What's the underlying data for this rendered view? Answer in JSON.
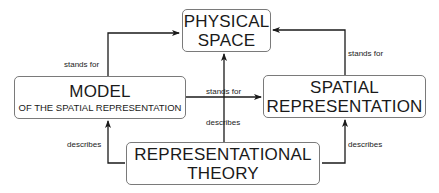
{
  "nodes": {
    "physical_space": {
      "line1": "PHYSICAL",
      "line2": "SPACE"
    },
    "model": {
      "title": "MODEL",
      "subtitle": "OF THE SPATIAL REPRESENTATION"
    },
    "spatial_representation": {
      "line1": "SPATIAL",
      "line2": "REPRESENTATION"
    },
    "representational_theory": {
      "line1": "REPRESENTATIONAL",
      "line2": "THEORY"
    }
  },
  "edges": {
    "model_to_physical": "stands for",
    "spatial_to_physical": "stands for",
    "model_to_spatial": "stands for",
    "theory_to_physical": "describes",
    "theory_to_model": "describes",
    "theory_to_spatial": "describes"
  },
  "colors": {
    "line": "#1a1a1a",
    "border": "#7a7a7a"
  }
}
